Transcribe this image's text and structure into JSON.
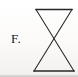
{
  "figure": {
    "label": "F.",
    "label_text": "F.",
    "caption": "",
    "background_color": "#fbfbf9",
    "ink_color": "#262626"
  },
  "shape": {
    "name": "bowtie-hourglass",
    "description": "Two triangles joined at a common apex forming a bowtie / hourglass outline",
    "stroke_color": "#262626",
    "stroke_width": 1.1,
    "fill": "none",
    "geometry": {
      "top_left": [
        5,
        4
      ],
      "top_right": [
        41,
        4
      ],
      "bottom_right": [
        43,
        66
      ],
      "bottom_left": [
        3,
        66
      ],
      "crossing_point": [
        23,
        36
      ]
    },
    "polyline_upper": "5,4 41,4 5,66 3,66",
    "path": "M5,4 L41,4 L3,66 L43,66 Z"
  },
  "icons": {
    "bowtie": "bowtie-icon"
  }
}
